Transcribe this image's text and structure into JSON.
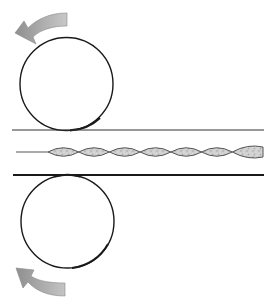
{
  "diagram": {
    "description": "Two counter-rotating rollers pressing a twisted strand between flat plates",
    "colors": {
      "background": "#ffffff",
      "outline": "#1a1a1a",
      "arrow_fill": "#9a9a9a",
      "arrow_light": "#c8c8c8",
      "strand_fill": "#c9c9c9",
      "strand_outline": "#555555",
      "plate_line": "#333333"
    },
    "top_roller": {
      "cx": 66.5,
      "cy": 84,
      "r": 46.5,
      "rotation": "counter-clockwise"
    },
    "bottom_roller": {
      "cx": 67.5,
      "cy": 221.5,
      "r": 46.5,
      "rotation": "clockwise"
    },
    "top_plate": {
      "x1": 12,
      "x2": 264,
      "y": 130,
      "stroke": 1.2
    },
    "bottom_plate": {
      "x1": 13,
      "x2": 264,
      "y": 175,
      "stroke": 2.2
    },
    "strand": {
      "lead_x1": 16,
      "lead_x2": 48,
      "y": 152,
      "segment_start": 48,
      "segment_end": 263,
      "segment_count": 7,
      "half_height": 8.5
    },
    "arrows": [
      {
        "name": "top-rotation-arrow",
        "direction": "left"
      },
      {
        "name": "bottom-rotation-arrow",
        "direction": "up-left"
      }
    ]
  }
}
